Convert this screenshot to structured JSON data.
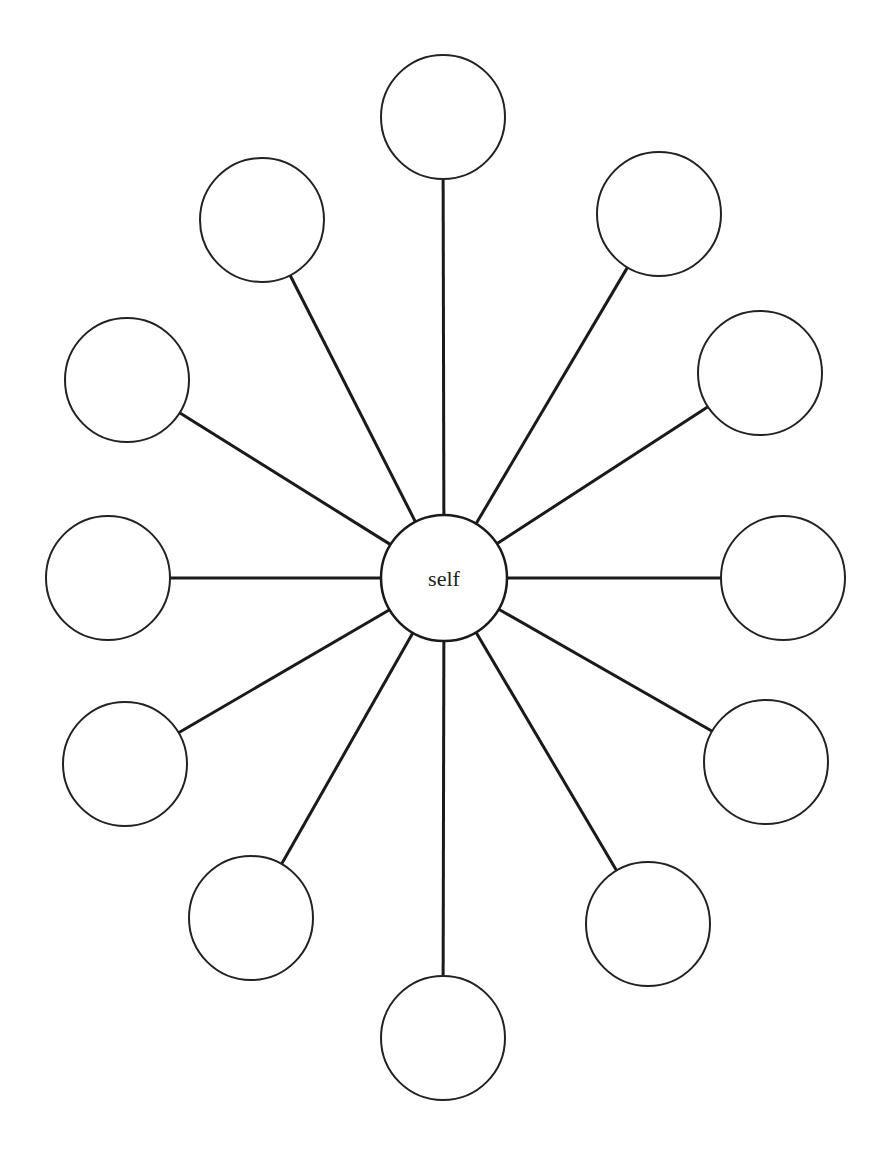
{
  "diagram": {
    "type": "hub-and-spoke",
    "center": {
      "label": "self",
      "cx": 444,
      "cy": 578,
      "r": 63
    },
    "outer_nodes": [
      {
        "id": "n1",
        "label": "",
        "cx": 443,
        "cy": 117,
        "r": 62
      },
      {
        "id": "n2",
        "label": "",
        "cx": 659,
        "cy": 214,
        "r": 62
      },
      {
        "id": "n3",
        "label": "",
        "cx": 760,
        "cy": 373,
        "r": 62
      },
      {
        "id": "n4",
        "label": "",
        "cx": 783,
        "cy": 578,
        "r": 62
      },
      {
        "id": "n5",
        "label": "",
        "cx": 766,
        "cy": 762,
        "r": 62
      },
      {
        "id": "n6",
        "label": "",
        "cx": 648,
        "cy": 924,
        "r": 62
      },
      {
        "id": "n7",
        "label": "",
        "cx": 443,
        "cy": 1038,
        "r": 62
      },
      {
        "id": "n8",
        "label": "",
        "cx": 251,
        "cy": 918,
        "r": 62
      },
      {
        "id": "n9",
        "label": "",
        "cx": 125,
        "cy": 764,
        "r": 62
      },
      {
        "id": "n10",
        "label": "",
        "cx": 108,
        "cy": 578,
        "r": 62
      },
      {
        "id": "n11",
        "label": "",
        "cx": 127,
        "cy": 380,
        "r": 62
      },
      {
        "id": "n12",
        "label": "",
        "cx": 262,
        "cy": 220,
        "r": 62
      }
    ]
  }
}
